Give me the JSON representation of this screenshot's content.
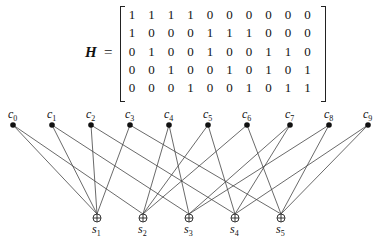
{
  "matrix_label": "H",
  "equals": "=",
  "matrix": [
    [
      1,
      1,
      1,
      1,
      0,
      0,
      0,
      0,
      0,
      0
    ],
    [
      1,
      0,
      0,
      0,
      1,
      1,
      1,
      0,
      0,
      0
    ],
    [
      0,
      1,
      0,
      0,
      1,
      0,
      0,
      1,
      1,
      0
    ],
    [
      0,
      0,
      1,
      0,
      0,
      1,
      0,
      1,
      0,
      1
    ],
    [
      0,
      0,
      0,
      1,
      0,
      0,
      1,
      0,
      1,
      1
    ]
  ],
  "variable_nodes": [
    "c0",
    "c1",
    "c2",
    "c3",
    "c4",
    "c5",
    "c6",
    "c7",
    "c8",
    "c9"
  ],
  "check_nodes": [
    "s1",
    "s2",
    "s3",
    "s4",
    "s5"
  ],
  "variable_x": [
    13,
    52,
    91,
    130,
    169,
    208,
    247,
    290,
    329,
    368
  ],
  "check_x": [
    97,
    143,
    189,
    235,
    281
  ],
  "variable_y": 125,
  "check_y": 218
}
